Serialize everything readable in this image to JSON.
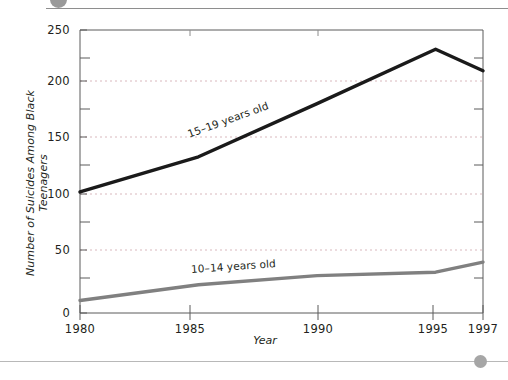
{
  "header": {
    "figure_caption": "",
    "bullet_icon": "circle-bullet-icon"
  },
  "footer": {
    "bullet_icon": "circle-bullet-icon"
  },
  "chart_data": {
    "type": "line",
    "title": "",
    "xlabel": "Year",
    "ylabel": "Number of Suicides Among Black Teenagers",
    "x": [
      1980,
      1985,
      1990,
      1995,
      1997
    ],
    "xlim": [
      1980,
      1997
    ],
    "ylim": [
      0,
      250
    ],
    "xticks": [
      "1980",
      "1985",
      "1990",
      "1995",
      "1997"
    ],
    "yticks": [
      "0",
      "50",
      "100",
      "150",
      "200",
      "250"
    ],
    "yminor_step": 25,
    "grid": "horizontal-dotted",
    "legend": "inline-series-labels",
    "series": [
      {
        "name": "15–19 years old",
        "color": "#1a1a1a",
        "values": [
          107,
          138,
          185,
          233,
          214
        ]
      },
      {
        "name": "10–14 years old",
        "color": "#808080",
        "values": [
          11,
          25,
          33,
          36,
          45
        ]
      }
    ]
  }
}
